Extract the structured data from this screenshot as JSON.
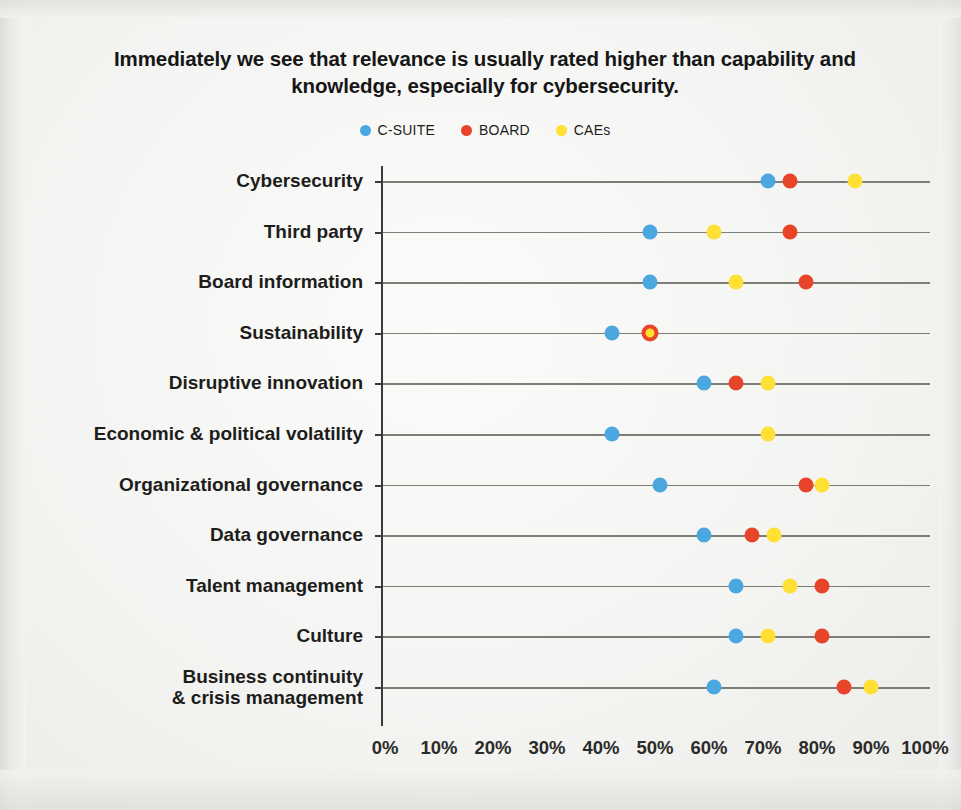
{
  "title": "Immediately we see that relevance is usually rated higher than capability and knowledge, especially for cybersecurity.",
  "legend": [
    {
      "label": "C-SUITE",
      "color": "#4BA7E0"
    },
    {
      "label": "BOARD",
      "color": "#E8442A"
    },
    {
      "label": "CAEs",
      "color": "#FFE033"
    }
  ],
  "chart_data": {
    "type": "scatter",
    "title": "Immediately we see that relevance is usually rated higher than capability and knowledge, especially for cybersecurity.",
    "xlabel": "",
    "ylabel": "",
    "xlim": [
      0,
      100
    ],
    "xtick_labels": [
      "0%",
      "10%",
      "20%",
      "30%",
      "40%",
      "50%",
      "60%",
      "70%",
      "80%",
      "90%",
      "100%"
    ],
    "xticks": [
      0,
      10,
      20,
      30,
      40,
      50,
      60,
      70,
      80,
      90,
      100
    ],
    "grid": false,
    "legend_position": "top-center",
    "orientation": "horizontal",
    "categories": [
      "Cybersecurity",
      "Third party",
      "Board information",
      "Sustainability",
      "Disruptive innovation",
      "Economic & political volatility",
      "Organizational governance",
      "Data governance",
      "Talent management",
      "Culture",
      "Business continuity\n& crisis management"
    ],
    "series": [
      {
        "name": "C-SUITE",
        "color": "#4BA7E0",
        "values": [
          71,
          49,
          49,
          42,
          59,
          42,
          51,
          59,
          65,
          65,
          61
        ]
      },
      {
        "name": "BOARD",
        "color": "#E8442A",
        "values": [
          75,
          75,
          78,
          49,
          65,
          null,
          78,
          68,
          81,
          81,
          85
        ]
      },
      {
        "name": "CAEs",
        "color": "#FFE033",
        "values": [
          87,
          61,
          65,
          49,
          71,
          71,
          81,
          72,
          75,
          71,
          90
        ]
      }
    ]
  }
}
